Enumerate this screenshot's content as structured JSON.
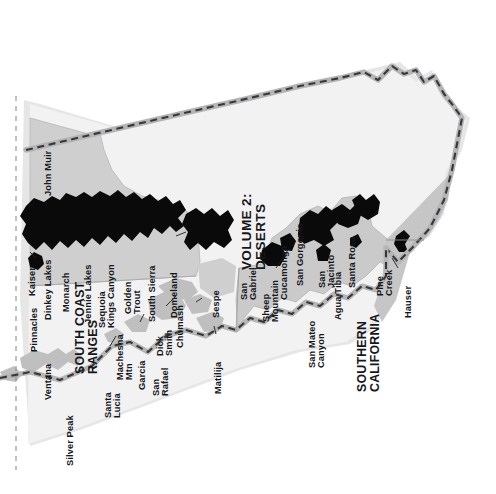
{
  "map": {
    "title": "California Wilderness Areas Overview Map",
    "orientation": "labels rotated 90 degrees counter-clockwise",
    "regions": [
      {
        "name": "VOLUME 2:",
        "line2": "DESERTS"
      },
      {
        "name": "SOUTH COAST",
        "line2": "RANGES"
      },
      {
        "name": "SOUTHERN",
        "line2": "CALIFORNIA"
      }
    ],
    "colors": {
      "page_background": "#ffffff",
      "land_light": "#f1f1f1",
      "land_mid": "#d8d8d8",
      "land_dark": "#c9c9c9",
      "wilderness_fill": "#0b0b0b",
      "wilderness_fill_gray": "#bdbdbd",
      "border_line": "#3a3c40",
      "border_halo": "#b9b9b9",
      "crop_dash": "#8d8d8d",
      "text": "#15171a"
    },
    "volume_label": {
      "line1": "VOLUME 2:",
      "line2": "DESERTS"
    },
    "south_coast_label": {
      "line1": "SOUTH COAST",
      "line2": "RANGES"
    },
    "southern_label": {
      "line1": "SOUTHERN",
      "line2": "CALIFORNIA"
    },
    "wilderness_areas": [
      {
        "id": "john-muir",
        "line1": "John Muir",
        "line2": ""
      },
      {
        "id": "kaiser",
        "line1": "Kaiser",
        "line2": ""
      },
      {
        "id": "dinkey-lakes",
        "line1": "Dinkey Lakes",
        "line2": ""
      },
      {
        "id": "monarch",
        "line1": "Monarch",
        "line2": ""
      },
      {
        "id": "jennie-lakes",
        "line1": "Jennie Lakes",
        "line2": ""
      },
      {
        "id": "sequoia-kings-canyon",
        "line1": "Sequoia",
        "line2": "Kings Canyon"
      },
      {
        "id": "golden-trout",
        "line1": "Golden",
        "line2": "Trout"
      },
      {
        "id": "south-sierra",
        "line1": "South Sierra",
        "line2": ""
      },
      {
        "id": "domeland",
        "line1": "Domeland",
        "line2": ""
      },
      {
        "id": "pinnacles",
        "line1": "Pinnacles",
        "line2": ""
      },
      {
        "id": "ventana",
        "line1": "Ventana",
        "line2": ""
      },
      {
        "id": "silver-peak",
        "line1": "Silver Peak",
        "line2": ""
      },
      {
        "id": "santa-lucia",
        "line1": "Santa",
        "line2": "Lucia"
      },
      {
        "id": "machesna-mtn",
        "line1": "Machesna",
        "line2": "Mtn"
      },
      {
        "id": "garcia",
        "line1": "Garcia",
        "line2": ""
      },
      {
        "id": "san-rafael",
        "line1": "San",
        "line2": "Rafael"
      },
      {
        "id": "dick-smith",
        "line1": "Dick",
        "line2": "Smith"
      },
      {
        "id": "chumash",
        "line1": "Chumash",
        "line2": ""
      },
      {
        "id": "matilija",
        "line1": "Matilija",
        "line2": ""
      },
      {
        "id": "sespe",
        "line1": "Sespe",
        "line2": ""
      },
      {
        "id": "san-gabriel",
        "line1": "San",
        "line2": "Gabriel"
      },
      {
        "id": "sheep-mountain",
        "line1": "Sheep",
        "line2": "Mountain"
      },
      {
        "id": "cucamonga",
        "line1": "Cucamonga",
        "line2": ""
      },
      {
        "id": "san-gorgonio",
        "line1": "San Gorgonio",
        "line2": ""
      },
      {
        "id": "san-jacinto",
        "line1": "San",
        "line2": "Jacinto"
      },
      {
        "id": "santa-rosa",
        "line1": "Santa Rosa",
        "line2": ""
      },
      {
        "id": "agua-tibia",
        "line1": "Agua Tibia",
        "line2": ""
      },
      {
        "id": "san-mateo-canyon",
        "line1": "San Mateo",
        "line2": "Canyon"
      },
      {
        "id": "pine-creek",
        "line1": "Pine",
        "line2": "Creek"
      },
      {
        "id": "hauser",
        "line1": "Hauser",
        "line2": ""
      }
    ]
  }
}
